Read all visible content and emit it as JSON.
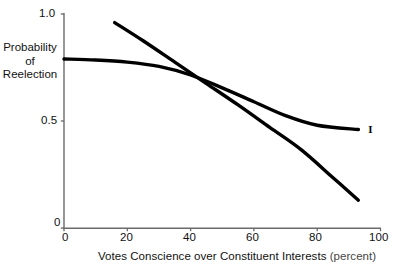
{
  "chart_data": {
    "type": "line",
    "title": "",
    "xlabel": "Votes Conscience over Constituent Interests (percent)",
    "xlabel_main": "Votes Conscience over Constituent Interests",
    "xlabel_unit": "(percent)",
    "ylabel": "Probability of Reelection",
    "ylabel_lines": [
      "Probability",
      "of",
      "Reelection"
    ],
    "xlim": [
      0,
      100
    ],
    "ylim": [
      0,
      1.0
    ],
    "xticks": [
      0,
      20,
      40,
      60,
      80,
      100
    ],
    "xticklabels": [
      "0",
      "20",
      "40",
      "60",
      "80",
      "100"
    ],
    "yticks": [
      0,
      0.5,
      1.0
    ],
    "yticklabels": [
      "0",
      "0.5",
      "1.0"
    ],
    "grid": false,
    "legend_position": "inline-right",
    "series": [
      {
        "name": "I",
        "label": "I",
        "color": "#000000",
        "linewidth": 3.4,
        "annotation": "I",
        "x": [
          0,
          10,
          20,
          30,
          40,
          50,
          60,
          70,
          80,
          93
        ],
        "y": [
          0.79,
          0.785,
          0.775,
          0.755,
          0.715,
          0.655,
          0.59,
          0.525,
          0.48,
          0.46
        ]
      },
      {
        "name": "steep-curve",
        "label": "",
        "color": "#000000",
        "linewidth": 3.4,
        "annotation": "",
        "x": [
          16,
          25,
          35,
          45,
          55,
          65,
          75,
          85,
          93
        ],
        "y": [
          0.96,
          0.875,
          0.775,
          0.675,
          0.575,
          0.47,
          0.365,
          0.235,
          0.13
        ]
      }
    ]
  },
  "colors": {
    "ink": "#000000",
    "axis": "#555555",
    "background": "#ffffff"
  }
}
